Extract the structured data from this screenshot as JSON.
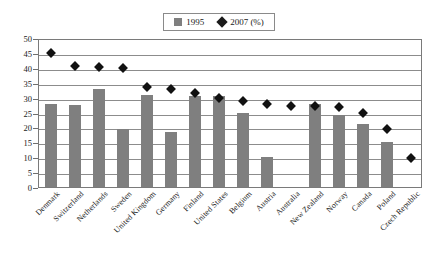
{
  "chart_data": {
    "type": "bar",
    "title": "",
    "subtitle": "",
    "xlabel": "",
    "ylabel": "",
    "ylim": [
      0,
      50
    ],
    "yticks": [
      0,
      5,
      10,
      15,
      20,
      25,
      30,
      35,
      40,
      45,
      50
    ],
    "grid": true,
    "legend_position": "top-center",
    "categories": [
      "Denmark",
      "Switzerland",
      "Netherlands",
      "Sweden",
      "United Kingdom",
      "Germany",
      "Finland",
      "United States",
      "Belgium",
      "Austria",
      "Australia",
      "New Zealand",
      "Norway",
      "Canada",
      "Poland",
      "Czech Republic"
    ],
    "series": [
      {
        "name": "1995",
        "type": "bar",
        "color": "#7f7f7f",
        "marker": "square",
        "values": [
          28,
          27.5,
          33,
          19.5,
          31,
          18.5,
          30.5,
          30.5,
          25,
          10,
          null,
          28,
          24,
          21,
          15,
          null
        ]
      },
      {
        "name": "2007 (%)",
        "type": "scatter",
        "color": "#111111",
        "marker": "diamond",
        "values": [
          45.7,
          41.2,
          41.1,
          40.7,
          34.2,
          33.5,
          32.2,
          30.5,
          29.5,
          28.5,
          28,
          28,
          27.5,
          25.5,
          20,
          10.5
        ]
      }
    ]
  },
  "legend": {
    "entries": [
      {
        "label": "1995",
        "marker": "square"
      },
      {
        "label": "2007 (%)",
        "marker": "diamond"
      }
    ]
  },
  "colors": {
    "bar": "#7f7f7f",
    "marker": "#111111",
    "grid": "#8c8c8c",
    "frame": "#7a7a7a",
    "background": "#ffffff"
  }
}
